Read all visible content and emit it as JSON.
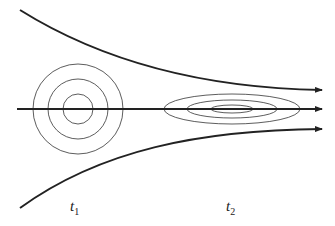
{
  "diagram": {
    "labels": {
      "t1": {
        "base": "t",
        "sub": "1"
      },
      "t2": {
        "base": "t",
        "sub": "2"
      }
    },
    "colors": {
      "stroke": "#222222",
      "background": "#ffffff"
    },
    "flow_lines": [
      {
        "name": "upper",
        "path": "M20,10 C100,60 200,88 322,90"
      },
      {
        "name": "center",
        "path": "M17,109 L322,109"
      },
      {
        "name": "lower",
        "path": "M20,208 C100,150 200,130 322,129"
      }
    ],
    "circles": {
      "cx": 78,
      "cy": 109,
      "radii": [
        15,
        30,
        45
      ]
    },
    "ellipses": {
      "cx": 232,
      "cy": 109,
      "shapes": [
        [
          68,
          15
        ],
        [
          45,
          9
        ],
        [
          21,
          4
        ]
      ]
    }
  }
}
